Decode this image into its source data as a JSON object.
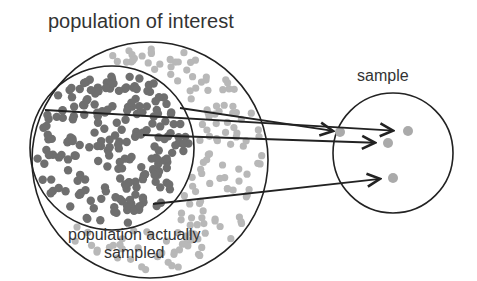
{
  "diagram": {
    "labels": {
      "population_of_interest": "population of interest",
      "sample": "sample",
      "population_actually_sampled_line1": "population actually",
      "population_actually_sampled_line2": "sampled"
    },
    "colors": {
      "stroke": "#222222",
      "dot_dark": "#6f6f6f",
      "dot_light": "#b8b8b8",
      "text": "#333333"
    },
    "shapes": {
      "population_of_interest": {
        "cx": 150,
        "cy": 160,
        "r": 118
      },
      "population_actually_sampled": {
        "cx": 112,
        "cy": 148,
        "r": 82
      },
      "sample": {
        "cx": 393,
        "cy": 153,
        "r": 60
      }
    },
    "arrows": [
      {
        "from": [
          45,
          110
        ],
        "to": [
          400,
          131
        ]
      },
      {
        "from": [
          180,
          108
        ],
        "to": [
          340,
          132
        ]
      },
      {
        "from": [
          143,
          135
        ],
        "to": [
          382,
          143
        ]
      },
      {
        "from": [
          153,
          204
        ],
        "to": [
          387,
          178
        ]
      }
    ],
    "sample_dots": [
      [
        408,
        131
      ],
      [
        388,
        143
      ],
      [
        393,
        178
      ],
      [
        340,
        132
      ]
    ]
  }
}
